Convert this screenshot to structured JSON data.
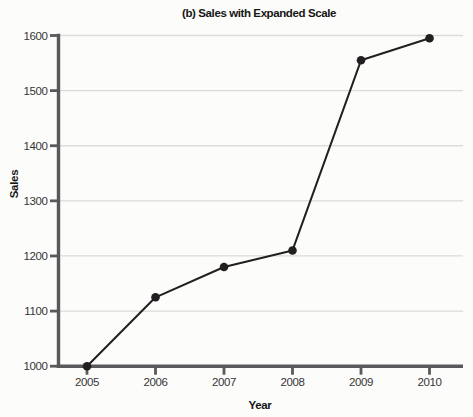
{
  "chart_data": {
    "type": "line",
    "title": "(b) Sales with Expanded Scale",
    "xlabel": "Year",
    "ylabel": "Sales",
    "x": [
      2005,
      2006,
      2007,
      2008,
      2009,
      2010
    ],
    "series": [
      {
        "name": "Sales",
        "values": [
          1000,
          1125,
          1180,
          1210,
          1555,
          1595
        ]
      }
    ],
    "ylim": [
      1000,
      1600
    ],
    "yticks": [
      1000,
      1100,
      1200,
      1300,
      1400,
      1500,
      1600
    ],
    "grid": "horizontal-only",
    "legend": "none",
    "marker": "filled-circle",
    "colors": {
      "line": "#231f20",
      "marker": "#231f20",
      "axis": "#58595b",
      "gridline": "#dbdbd7",
      "tick_text": "#353537",
      "label_text": "#161616",
      "background": "#fcfcfa"
    }
  }
}
